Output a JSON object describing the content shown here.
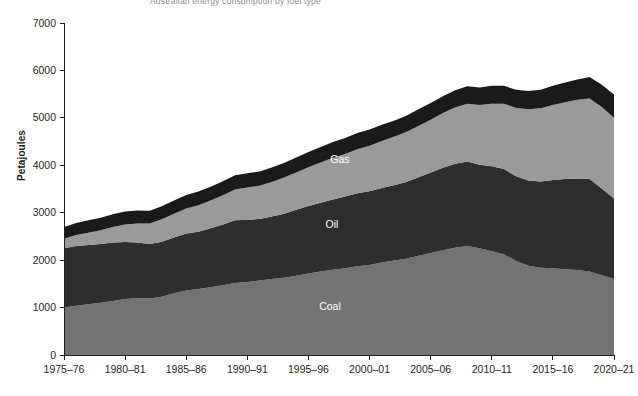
{
  "figure": {
    "title": "Australian energy consumption by fuel type",
    "width": 638,
    "height": 396,
    "background": "#ffffff"
  },
  "axis": {
    "ylabel": "Petajoules",
    "yticks": [
      "0",
      "1000",
      "2000",
      "3000",
      "4000",
      "5000",
      "6000",
      "7000"
    ],
    "xticks": [
      "1975–76",
      "1980–81",
      "1985–86",
      "1990–91",
      "1995–96",
      "2000–01",
      "2005–06",
      "2010–11",
      "2015–16",
      "2020–21"
    ]
  },
  "series_labels": {
    "renewables": "Renewables",
    "gas": "Gas",
    "oil": "Oil",
    "coal": "Coal"
  },
  "colors": {
    "coal": "#737373",
    "oil": "#2e2e2e",
    "gas": "#9a9a9a",
    "renewables": "#1a1a1a",
    "axis": "#231f20",
    "title": "#8d8d8d",
    "label_text": "#ffffff"
  },
  "chart_data": {
    "type": "area",
    "stacked": true,
    "title": "Australian energy consumption by fuel type",
    "xlabel": "",
    "ylabel": "Petajoules",
    "ylim": [
      0,
      7000
    ],
    "ytick_step": 1000,
    "grid": false,
    "legend": "inline-labels",
    "categories": [
      "1975–76",
      "1976–77",
      "1977–78",
      "1978–79",
      "1979–80",
      "1980–81",
      "1981–82",
      "1982–83",
      "1983–84",
      "1984–85",
      "1985–86",
      "1986–87",
      "1987–88",
      "1988–89",
      "1989–90",
      "1990–91",
      "1991–92",
      "1992–93",
      "1993–94",
      "1994–95",
      "1995–96",
      "1996–97",
      "1997–98",
      "1998–99",
      "1999–00",
      "2000–01",
      "2001–02",
      "2002–03",
      "2003–04",
      "2004–05",
      "2005–06",
      "2006–07",
      "2007–08",
      "2008–09",
      "2009–10",
      "2010–11",
      "2011–12",
      "2012–13",
      "2013–14",
      "2014–15",
      "2015–16",
      "2016–17",
      "2017–18",
      "2018–19",
      "2019–20",
      "2020–21"
    ],
    "series": [
      {
        "name": "Coal",
        "color": "#737373",
        "values": [
          1000,
          1040,
          1070,
          1100,
          1140,
          1180,
          1200,
          1190,
          1230,
          1300,
          1360,
          1390,
          1430,
          1470,
          1520,
          1540,
          1570,
          1600,
          1630,
          1670,
          1720,
          1760,
          1800,
          1830,
          1870,
          1900,
          1950,
          1990,
          2030,
          2090,
          2150,
          2210,
          2260,
          2300,
          2250,
          2190,
          2120,
          1980,
          1880,
          1840,
          1830,
          1810,
          1790,
          1760,
          1680,
          1600
        ]
      },
      {
        "name": "Oil",
        "color": "#2e2e2e",
        "values": [
          1250,
          1260,
          1250,
          1240,
          1230,
          1200,
          1170,
          1150,
          1160,
          1180,
          1200,
          1210,
          1240,
          1280,
          1320,
          1310,
          1300,
          1320,
          1350,
          1390,
          1420,
          1450,
          1480,
          1510,
          1540,
          1550,
          1570,
          1590,
          1620,
          1660,
          1700,
          1740,
          1770,
          1780,
          1760,
          1790,
          1800,
          1790,
          1800,
          1820,
          1860,
          1900,
          1930,
          1950,
          1830,
          1700
        ]
      },
      {
        "name": "Gas",
        "color": "#9a9a9a",
        "values": [
          200,
          230,
          260,
          290,
          330,
          370,
          400,
          430,
          470,
          500,
          530,
          560,
          590,
          620,
          650,
          680,
          700,
          730,
          760,
          790,
          820,
          850,
          880,
          900,
          930,
          960,
          990,
          1020,
          1050,
          1080,
          1110,
          1150,
          1190,
          1220,
          1260,
          1320,
          1380,
          1440,
          1500,
          1540,
          1580,
          1620,
          1660,
          1700,
          1720,
          1700
        ]
      },
      {
        "name": "Renewables",
        "color": "#1a1a1a",
        "values": [
          250,
          255,
          260,
          265,
          270,
          275,
          275,
          270,
          275,
          280,
          285,
          285,
          290,
          295,
          300,
          300,
          300,
          305,
          310,
          315,
          320,
          325,
          330,
          335,
          340,
          345,
          345,
          340,
          345,
          350,
          355,
          355,
          360,
          365,
          370,
          375,
          375,
          380,
          385,
          395,
          405,
          415,
          430,
          450,
          470,
          490
        ]
      }
    ],
    "totals": [
      2700,
      2785,
      2840,
      2895,
      2970,
      3025,
      3045,
      3040,
      3135,
      3260,
      3375,
      3445,
      3550,
      3665,
      3790,
      3830,
      3870,
      3955,
      4050,
      4165,
      4280,
      4385,
      4490,
      4575,
      4680,
      4755,
      4855,
      4940,
      5045,
      5180,
      5315,
      5455,
      5580,
      5665,
      5640,
      5675,
      5675,
      5590,
      5565,
      5595,
      5675,
      5745,
      5810,
      5860,
      5700,
      5490
    ]
  }
}
